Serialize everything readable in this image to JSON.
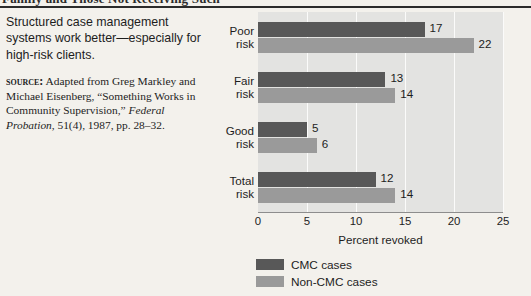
{
  "header": {
    "running_title": "Family and Those Not Receiving Such"
  },
  "caption": {
    "text": "Structured case management systems work better—especially for high-risk clients."
  },
  "source": {
    "label": "Source:",
    "part1": " Adapted from Greg Markley and Michael Eisenberg, “Something Works in Community Supervision,” ",
    "italic": "Federal Probation",
    "part2": ", 51(4), 1987, pp. 28–32."
  },
  "chart_data": {
    "type": "bar",
    "orientation": "horizontal",
    "title": "",
    "xlabel": "Percent revoked",
    "ylabel": "",
    "xlim": [
      0,
      25
    ],
    "xticks": [
      0,
      5,
      10,
      15,
      20,
      25
    ],
    "grid": true,
    "legend_position": "bottom-left",
    "categories": [
      "Poor\nrisk",
      "Fair\nrisk",
      "Good\nrisk",
      "Total\nrisk"
    ],
    "series": [
      {
        "name": "CMC cases",
        "color": "#585858",
        "values": [
          17,
          13,
          5,
          12
        ]
      },
      {
        "name": "Non-CMC cases",
        "color": "#9a9a9a",
        "values": [
          22,
          14,
          6,
          14
        ]
      }
    ]
  },
  "colors": {
    "page_background": "#f3f1ec",
    "plot_background": "#e3e3e1",
    "gridline": "#fbfbfa",
    "cmc_bar": "#585858",
    "noncmc_bar": "#9a9a9a",
    "text": "#1d1d1d"
  }
}
